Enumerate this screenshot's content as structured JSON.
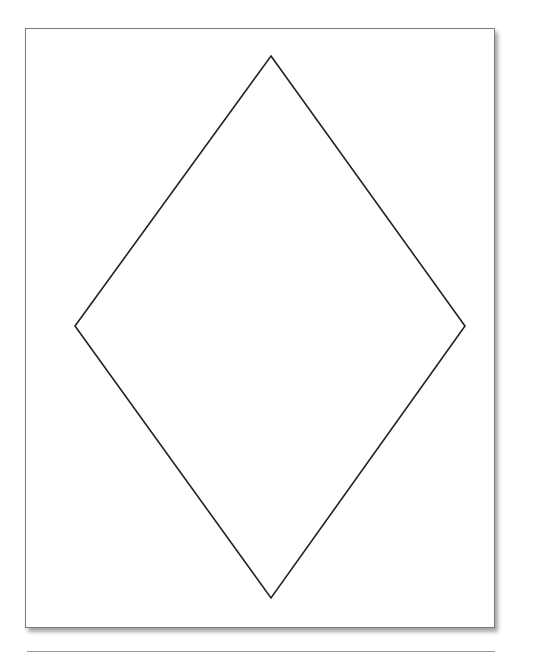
{
  "diagram": {
    "shape": "rhombus",
    "stroke_color": "#222222",
    "stroke_width": 1.6,
    "points": [
      [
        271,
        56
      ],
      [
        465,
        326
      ],
      [
        271,
        598
      ],
      [
        75,
        326
      ]
    ]
  },
  "page": {
    "border_color": "#7a7a7a",
    "background": "#ffffff"
  }
}
